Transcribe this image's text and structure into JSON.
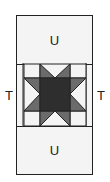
{
  "diagram": {
    "top_panel_label": "U",
    "bottom_panel_label": "U",
    "left_side_label": "T",
    "right_side_label": "T",
    "colors": {
      "border": "#222222",
      "panel_fill": "#f4f4f4",
      "star_points": "#6b6b6b",
      "star_center": "#2e2e2e"
    }
  }
}
